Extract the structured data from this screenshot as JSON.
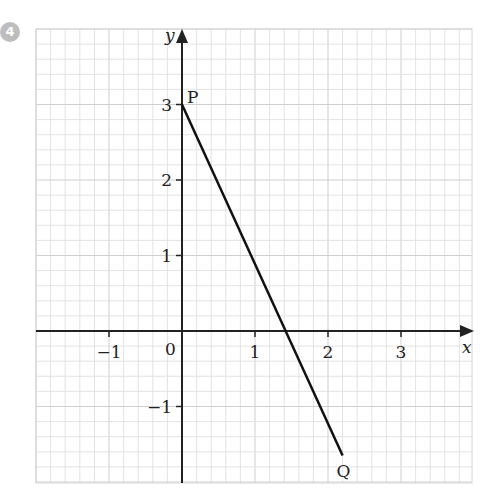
{
  "question_number": "4",
  "chart_data": {
    "type": "line",
    "title": "",
    "xlabel": "x",
    "ylabel": "y",
    "xlim": [
      -2,
      4
    ],
    "ylim": [
      -2,
      4
    ],
    "grid": true,
    "grid_minor_step": 0.2,
    "x_ticks": [
      -1,
      1,
      2,
      3
    ],
    "y_ticks": [
      -1,
      1,
      2,
      3
    ],
    "x_tick_labels": [
      "−1",
      "1",
      "2",
      "3"
    ],
    "y_tick_labels": [
      "−1",
      "1",
      "2",
      "3"
    ],
    "origin_label": "0",
    "series": [
      {
        "name": "PQ",
        "points": [
          {
            "label": "P",
            "x": 0,
            "y": 3
          },
          {
            "label": "Q",
            "x": 2.2,
            "y": -1.65
          }
        ]
      }
    ],
    "point_labels": {
      "P": "P",
      "Q": "Q"
    }
  },
  "colors": {
    "grid": "#dcdcdc",
    "axis": "#222222",
    "line": "#111111",
    "badge": "#bdbdbd"
  }
}
